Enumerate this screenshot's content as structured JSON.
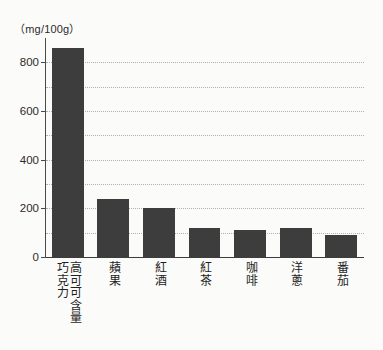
{
  "chart_data": {
    "type": "bar",
    "title": "",
    "subtitle": "",
    "xlabel": "",
    "ylabel": "",
    "unit_label": "（mg/100g）",
    "ylim": [
      0,
      900
    ],
    "yticks": [
      0,
      200,
      400,
      600,
      800
    ],
    "ytick_labels": [
      "0",
      "200",
      "400",
      "600",
      "800"
    ],
    "gridlines": [
      100,
      200,
      300,
      400,
      500,
      600,
      700,
      800
    ],
    "grid": true,
    "legend": "none",
    "bar_color": "#3d3d3d",
    "background_color": "#fbfbf9",
    "grid_color": "#b3b3ad",
    "axis_color": "#4a4a4a",
    "categories": [
      "高可可含量巧克力",
      "蘋果",
      "紅酒",
      "紅茶",
      "咖啡",
      "洋蔥",
      "番茄"
    ],
    "category_lines": [
      [
        "高可可含量",
        "巧克力"
      ],
      [
        "蘋果"
      ],
      [
        "紅酒"
      ],
      [
        "紅茶"
      ],
      [
        "咖啡"
      ],
      [
        "洋蔥"
      ],
      [
        "番茄"
      ]
    ],
    "values": [
      860,
      240,
      200,
      118,
      112,
      118,
      90
    ]
  }
}
